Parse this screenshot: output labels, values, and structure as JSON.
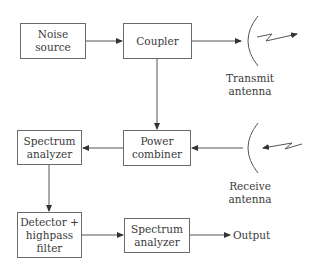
{
  "diagram": {
    "type": "block-diagram",
    "blocks": {
      "noise_source": {
        "lines": [
          "Noise",
          "source"
        ]
      },
      "coupler": {
        "lines": [
          "Coupler"
        ]
      },
      "spectrum_analyzer_1": {
        "lines": [
          "Spectrum",
          "analyzer"
        ]
      },
      "power_combiner": {
        "lines": [
          "Power",
          "combiner"
        ]
      },
      "detector_filter": {
        "lines": [
          "Detector +",
          "highpass",
          "filter"
        ]
      },
      "spectrum_analyzer_2": {
        "lines": [
          "Spectrum",
          "analyzer"
        ]
      }
    },
    "antennas": {
      "transmit": {
        "lines": [
          "Transmit",
          "antenna"
        ]
      },
      "receive": {
        "lines": [
          "Receive",
          "antenna"
        ]
      }
    },
    "output_label": "Output",
    "connections": [
      [
        "Noise source",
        "Coupler"
      ],
      [
        "Coupler",
        "Transmit antenna"
      ],
      [
        "Coupler",
        "Power combiner"
      ],
      [
        "Receive antenna",
        "Power combiner"
      ],
      [
        "Power combiner",
        "Spectrum analyzer"
      ],
      [
        "Spectrum analyzer",
        "Detector + highpass filter"
      ],
      [
        "Detector + highpass filter",
        "Spectrum analyzer"
      ],
      [
        "Spectrum analyzer",
        "Output"
      ]
    ],
    "line_color": "#555555"
  }
}
